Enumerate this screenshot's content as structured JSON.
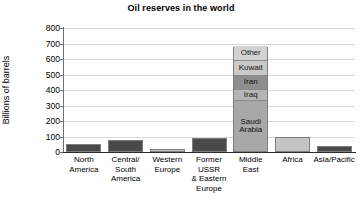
{
  "chart_data": {
    "type": "bar",
    "title": "Oil reserves in the world",
    "xlabel": "",
    "ylabel": "Billions of barrels",
    "ylim": [
      0,
      800
    ],
    "ytick_values": [
      800,
      700,
      600,
      500,
      400,
      300,
      200,
      100,
      0
    ],
    "ytick_labels": [
      "800",
      "700",
      "600",
      "500",
      "400",
      "300",
      "200",
      "100",
      "0"
    ],
    "grid": true,
    "legend": "none",
    "categories": [
      "North\nAmerica",
      "Central/\nSouth\nAmerica",
      "Western\nEurope",
      "Former\nUSSR\n& Eastern\nEurope",
      "Middle\nEast",
      "Africa",
      "Asia/Pacific"
    ],
    "values": [
      50,
      80,
      20,
      90,
      680,
      100,
      40
    ],
    "bar_colors": [
      "#4a4a4a",
      "#4a4a4a",
      "#c4c4c4",
      "#4a4a4a",
      "#9a9a9a",
      "#c4c4c4",
      "#4a4a4a"
    ],
    "stacked_bar": {
      "category": "Middle\nEast",
      "category_index": 4,
      "total": 680,
      "segments": [
        {
          "label": "Saudi\nArabia",
          "value": 320,
          "color": "#a8a8a8"
        },
        {
          "label": "Iraq",
          "value": 75,
          "color": "#b5b5b5"
        },
        {
          "label": "Iran",
          "value": 90,
          "color": "#8e8e8e"
        },
        {
          "label": "Kuwait",
          "value": 95,
          "color": "#c9c9c9"
        },
        {
          "label": "Other",
          "value": 100,
          "color": "#d2d2d2"
        }
      ]
    }
  }
}
